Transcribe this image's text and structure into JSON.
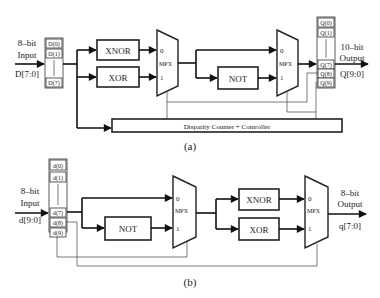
{
  "diagram_a": {
    "caption": "(a)",
    "input": {
      "line1": "8–bit",
      "line2": "Input",
      "line3": "D[7:0]"
    },
    "input_register": [
      "D(0)",
      "D(1)",
      "D(7)"
    ],
    "gates": {
      "xnor": "XNOR",
      "xor": "XOR",
      "not": "NOT"
    },
    "mux1": {
      "in0": "0",
      "label": "MPX",
      "in1": "1"
    },
    "mux2": {
      "in0": "0",
      "label": "MPX",
      "in1": "1"
    },
    "output_register": [
      "Q(0)",
      "Q(1)",
      "Q(7)",
      "Q(8)",
      "Q(9)"
    ],
    "output": {
      "line1": "10–bit",
      "line2": "Output",
      "line3": "Q[9:0]"
    },
    "controller": "Disparity Counter + Controller"
  },
  "diagram_b": {
    "caption": "(b)",
    "input": {
      "line1": "8–bit",
      "line2": "Input",
      "line3": "d[9:0]"
    },
    "input_register": [
      "d(0)",
      "d(1)",
      "d(7)",
      "d(8)",
      "d(9)"
    ],
    "gates": {
      "not": "NOT",
      "xnor": "XNOR",
      "xor": "XOR"
    },
    "mux1": {
      "in0": "0",
      "label": "MPX",
      "in1": "1"
    },
    "mux2": {
      "in0": "0",
      "label": "MPX",
      "in1": "1"
    },
    "output": {
      "line1": "8–bit",
      "line2": "Output",
      "line3": "q[7:0]"
    }
  }
}
